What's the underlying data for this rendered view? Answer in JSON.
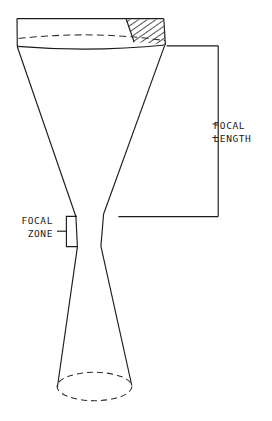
{
  "figure": {
    "background_color": "#ffffff",
    "line_color": "#1c1c1c"
  },
  "labels": {
    "focal_length_line1": "FOCAL",
    "focal_length_line2": "LENGTH",
    "focal_zone_line1": "FOCAL",
    "focal_zone_line2": "ZONE"
  },
  "geometry": {
    "transducer_face_left_x": 17,
    "transducer_face_right_x": 164,
    "transducer_top_y": 18,
    "transducer_front_y": 46,
    "beam_waist_top_y": 216,
    "beam_waist_bottom_y": 246,
    "beam_waist_left_x": 76,
    "beam_waist_right_x": 103,
    "aperture_bottom_y": 392,
    "aperture_left_x": 57,
    "aperture_right_x": 132,
    "focal_length_bracket_x": 218,
    "focal_length_top_y": 46,
    "focal_length_bottom_y": 216,
    "focal_zone_bracket_x": 66
  },
  "annotations": {
    "hatched_element": "transducer-element-hatching",
    "curved_face": "concave-focusing-lens-face",
    "focal_length_extent": "from transducer face to focal zone",
    "focal_zone_extent": "narrow waist region of the beam"
  }
}
